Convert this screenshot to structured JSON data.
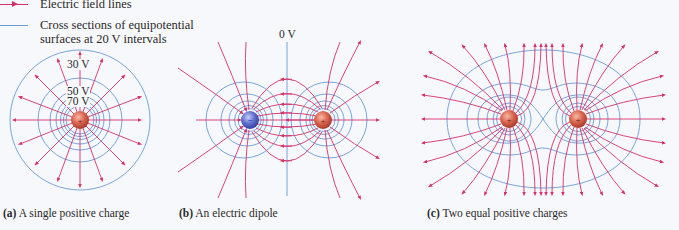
{
  "legend": {
    "field_lines": {
      "label": "Electric field lines",
      "color": "#d6306b"
    },
    "equipotentials": {
      "label": "Cross sections of equipotential\nsurfaces at 20 V intervals",
      "color": "#6a9bd6"
    }
  },
  "panels": [
    {
      "id": "a",
      "caption_tag": "(a)",
      "caption_text": " A single positive charge",
      "charges": [
        {
          "sign": "+",
          "x": 80,
          "y": 120
        }
      ],
      "potential_labels": [
        "30 V",
        "50 V",
        "70 V"
      ]
    },
    {
      "id": "b",
      "caption_tag": "(b)",
      "caption_text": " An electric dipole",
      "charges": [
        {
          "sign": "−",
          "x": 250,
          "y": 120
        },
        {
          "sign": "+",
          "x": 323,
          "y": 120
        }
      ],
      "potential_labels": [
        "0 V"
      ]
    },
    {
      "id": "c",
      "caption_tag": "(c)",
      "caption_text": " Two equal positive charges",
      "charges": [
        {
          "sign": "+",
          "x": 509,
          "y": 119
        },
        {
          "sign": "+",
          "x": 578,
          "y": 119
        }
      ],
      "potential_labels": []
    }
  ],
  "colors": {
    "field": "#d6306b",
    "equipotential": "#6a9bd6",
    "positive_charge": "#d9634e",
    "negative_charge": "#5e6fd0",
    "background": "#f7f8fb"
  }
}
